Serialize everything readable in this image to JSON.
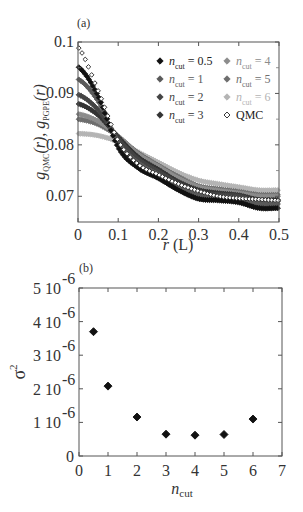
{
  "figure": {
    "panel_a_label": "(a)",
    "panel_b_label": "(b)"
  },
  "chart_data": [
    {
      "type": "scatter",
      "panel": "(a)",
      "title": "",
      "xlabel": "r (L)",
      "ylabel": "g_QMC(r), g_PGPE(r)",
      "xlim": [
        0,
        0.5
      ],
      "ylim": [
        0.065,
        0.1
      ],
      "xticks": [
        "0",
        "0.1",
        "0.2",
        "0.3",
        "0.4",
        "0.5"
      ],
      "yticks": [
        "0.07",
        "0.08",
        "0.09",
        "0.1"
      ],
      "grid": false,
      "legend_position": "upper right (inside)",
      "x": [
        0,
        0.05,
        0.1,
        0.15,
        0.2,
        0.25,
        0.3,
        0.35,
        0.4,
        0.45,
        0.5
      ],
      "series": [
        {
          "name": "n_cut = 0.5",
          "color": "#111111",
          "marker": "filled-diamond",
          "values": [
            0.0952,
            0.0895,
            0.0795,
            0.0755,
            0.0735,
            0.0712,
            0.0695,
            0.0692,
            0.0688,
            0.0677,
            0.0677
          ]
        },
        {
          "name": "n_cut = 1",
          "color": "#5a5a5a",
          "marker": "filled-diamond",
          "values": [
            0.0928,
            0.0885,
            0.0805,
            0.0765,
            0.0742,
            0.0718,
            0.0703,
            0.0699,
            0.0695,
            0.0685,
            0.0685
          ]
        },
        {
          "name": "n_cut = 2",
          "color": "#444444",
          "marker": "filled-diamond",
          "values": [
            0.0898,
            0.0868,
            0.0812,
            0.0772,
            0.0748,
            0.0725,
            0.0708,
            0.0703,
            0.07,
            0.069,
            0.069
          ]
        },
        {
          "name": "n_cut = 3",
          "color": "#333333",
          "marker": "filled-diamond",
          "values": [
            0.088,
            0.0858,
            0.0815,
            0.0776,
            0.0752,
            0.0728,
            0.0712,
            0.0706,
            0.0702,
            0.0693,
            0.0693
          ]
        },
        {
          "name": "n_cut = 4",
          "color": "#8c8c8c",
          "marker": "filled-diamond",
          "values": [
            0.086,
            0.0846,
            0.0817,
            0.0782,
            0.0758,
            0.0735,
            0.0718,
            0.0711,
            0.0706,
            0.07,
            0.07
          ]
        },
        {
          "name": "n_cut = 5",
          "color": "#6e6e6e",
          "marker": "filled-diamond",
          "values": [
            0.085,
            0.084,
            0.0816,
            0.0784,
            0.076,
            0.0738,
            0.072,
            0.0714,
            0.0709,
            0.0703,
            0.0703
          ]
        },
        {
          "name": "n_cut = 6",
          "color": "#b4b4b4",
          "marker": "filled-diamond",
          "values": [
            0.0822,
            0.0818,
            0.0806,
            0.0786,
            0.0766,
            0.0746,
            0.0731,
            0.0724,
            0.0718,
            0.0712,
            0.0712
          ]
        },
        {
          "name": "QMC",
          "color": "#222222",
          "marker": "open-diamond",
          "values": [
            0.099,
            0.0905,
            0.0808,
            0.0762,
            0.0742,
            0.0724,
            0.071,
            0.07,
            0.0696,
            0.0694,
            0.0692
          ]
        }
      ]
    },
    {
      "type": "scatter",
      "panel": "(b)",
      "title": "",
      "xlabel": "n_cut",
      "ylabel": "σ²",
      "xlim": [
        0,
        7
      ],
      "ylim": [
        0,
        5e-06
      ],
      "xticks": [
        "0",
        "1",
        "2",
        "3",
        "4",
        "5",
        "6",
        "7"
      ],
      "yticks": [
        "0",
        "1 10^-6",
        "2 10^-6",
        "3 10^-6",
        "4 10^-6",
        "5 10^-6"
      ],
      "grid": false,
      "x": [
        0.5,
        1,
        2,
        3,
        4,
        5,
        6
      ],
      "values": [
        3.7e-06,
        2.08e-06,
        1.16e-06,
        6.5e-07,
        6.2e-07,
        6.4e-07,
        1.1e-06
      ],
      "marker": "filled-diamond",
      "color": "#111111"
    }
  ],
  "panel_a": {
    "xlabel_var": "r",
    "xlabel_unit": "(L)",
    "ylabel_g": "g",
    "ylabel_sub1": "QMC",
    "ylabel_sub2": "PGPE",
    "ylabel_arg1": "(r), ",
    "ylabel_arg2": "(r)",
    "xticks": [
      "0",
      "0.1",
      "0.2",
      "0.3",
      "0.4",
      "0.5"
    ],
    "yticks": [
      "0.07",
      "0.08",
      "0.09",
      "0.1"
    ],
    "legend": [
      {
        "n": "n",
        "sub": "cut",
        "eq": " = 0.5",
        "color": "#111111",
        "marker": "◆"
      },
      {
        "n": "n",
        "sub": "cut",
        "eq": " = 1",
        "color": "#5a5a5a",
        "marker": "◆"
      },
      {
        "n": "n",
        "sub": "cut",
        "eq": " = 2",
        "color": "#444444",
        "marker": "◆"
      },
      {
        "n": "n",
        "sub": "cut",
        "eq": " = 3",
        "color": "#333333",
        "marker": "◆"
      },
      {
        "n": "n",
        "sub": "cut",
        "eq": " = 4",
        "color": "#8c8c8c",
        "marker": "◆"
      },
      {
        "n": "n",
        "sub": "cut",
        "eq": " = 5",
        "color": "#6e6e6e",
        "marker": "◆"
      },
      {
        "n": "n",
        "sub": "cut",
        "eq": " = 6",
        "color": "#b4b4b4",
        "marker": "◆"
      },
      {
        "n": "",
        "sub": "",
        "eq": "QMC",
        "color": "#222222",
        "marker": "◇"
      }
    ]
  },
  "panel_b": {
    "ylabel_sigma": "σ",
    "ylabel_exp": "2",
    "xlabel_n": "n",
    "xlabel_sub": "cut",
    "xticks": [
      "0",
      "1",
      "2",
      "3",
      "4",
      "5",
      "6",
      "7"
    ],
    "yticks": [
      {
        "mant": "0",
        "exp": ""
      },
      {
        "mant": "1 10",
        "exp": "-6"
      },
      {
        "mant": "2 10",
        "exp": "-6"
      },
      {
        "mant": "3 10",
        "exp": "-6"
      },
      {
        "mant": "4 10",
        "exp": "-6"
      },
      {
        "mant": "5 10",
        "exp": "-6"
      }
    ]
  }
}
